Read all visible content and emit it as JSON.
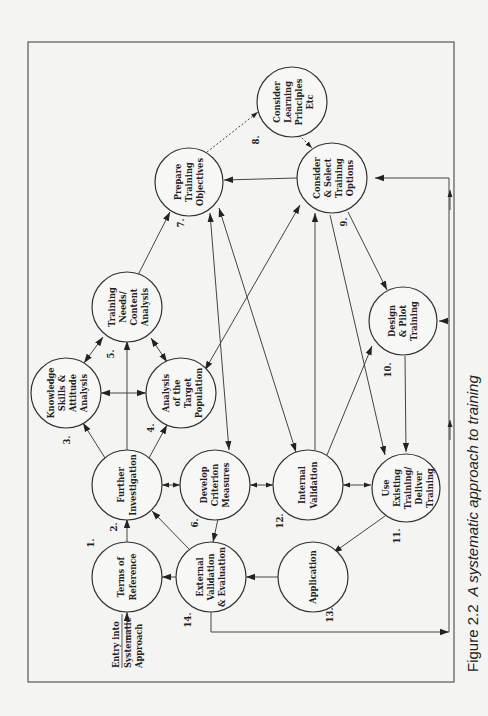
{
  "figure": {
    "caption_number": "Figure 2.2",
    "caption_text": "A systematic approach to training"
  },
  "entry": {
    "line1": "Entry into",
    "line2": "Systematic",
    "line3": "Approach"
  },
  "nodes": [
    {
      "id": 1,
      "number": "1.",
      "lines": [
        "Terms of",
        "Reference"
      ]
    },
    {
      "id": 2,
      "number": "2.",
      "lines": [
        "Further",
        "Investigation"
      ]
    },
    {
      "id": 3,
      "number": "3.",
      "lines": [
        "Knowledge",
        "Skills &",
        "Attitude",
        "Analysis"
      ]
    },
    {
      "id": 4,
      "number": "4.",
      "lines": [
        "Analysis",
        "of the",
        "Target",
        "Population"
      ]
    },
    {
      "id": 5,
      "number": "5.",
      "lines": [
        "Training",
        "Needs/",
        "Content",
        "Analysis"
      ]
    },
    {
      "id": 6,
      "number": "6.",
      "lines": [
        "Develop",
        "Criterion",
        "Measures"
      ]
    },
    {
      "id": 7,
      "number": "7.",
      "lines": [
        "Prepare",
        "Training",
        "Objectives"
      ]
    },
    {
      "id": 8,
      "number": "8.",
      "lines": [
        "Consider",
        "Learning",
        "Principles",
        "Etc"
      ]
    },
    {
      "id": 9,
      "number": "9.",
      "lines": [
        "Consider",
        "& Select",
        "Training",
        "Options"
      ]
    },
    {
      "id": 10,
      "number": "10.",
      "lines": [
        "Design",
        "& Pilot",
        "Training"
      ]
    },
    {
      "id": 11,
      "number": "11.",
      "lines": [
        "Use",
        "Existing",
        "Training/",
        "Deliver",
        "Training"
      ]
    },
    {
      "id": 12,
      "number": "12.",
      "lines": [
        "Internal",
        "Validation"
      ]
    },
    {
      "id": 13,
      "number": "13.",
      "lines": [
        "Application"
      ]
    },
    {
      "id": 14,
      "number": "14.",
      "lines": [
        "External",
        "Validation",
        "& Evaluation"
      ]
    }
  ],
  "colors": {
    "background": "#f4f4f2",
    "line": "#444444",
    "text": "#222222"
  }
}
